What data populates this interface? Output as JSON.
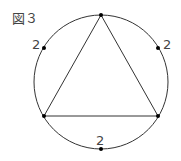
{
  "figure": {
    "label": "図３"
  },
  "arc_labels": {
    "upper_left": "2",
    "upper_right": "2",
    "bottom": "2"
  },
  "colors": {
    "stroke": "#333333",
    "text": "#444444"
  }
}
